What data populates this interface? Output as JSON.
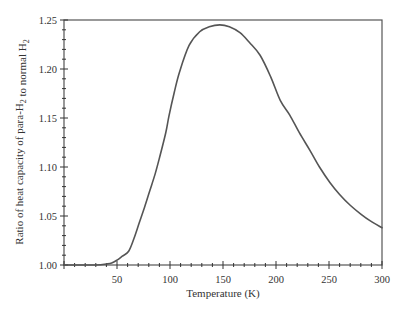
{
  "chart_data": {
    "type": "line",
    "title": "",
    "xlabel": "Temperature (K)",
    "ylabel": "Ratio of heat capacity of para-H₂ to normal H₂",
    "xlim": [
      0,
      300
    ],
    "ylim": [
      1.0,
      1.25
    ],
    "x_ticks": [
      50,
      100,
      150,
      200,
      250,
      300
    ],
    "x_tick_labels": [
      "50",
      "100",
      "150",
      "200",
      "250",
      "300"
    ],
    "x_minor_step": 10,
    "y_ticks": [
      1.0,
      1.05,
      1.1,
      1.15,
      1.2,
      1.25
    ],
    "y_tick_labels": [
      "1.00",
      "1.05",
      "1.10",
      "1.15",
      "1.20",
      "1.25"
    ],
    "y_minor_step": 0.01,
    "grid": false,
    "legend": null,
    "series": [
      {
        "name": "para-H2 / normal H2 heat capacity ratio",
        "color": "#555555",
        "x": [
          0,
          10,
          20,
          30,
          40,
          45,
          50,
          55,
          61,
          66,
          71,
          76,
          81,
          86,
          90,
          96,
          99,
          104,
          109,
          118,
          128,
          137,
          147,
          156,
          166,
          175,
          185,
          195,
          204,
          213,
          222,
          232,
          241,
          251,
          260,
          270,
          280,
          289,
          300
        ],
        "y": [
          1.0,
          1.0,
          1.0,
          1.0,
          1.001,
          1.002,
          1.005,
          1.009,
          1.014,
          1.027,
          1.043,
          1.059,
          1.076,
          1.093,
          1.109,
          1.135,
          1.152,
          1.176,
          1.197,
          1.224,
          1.238,
          1.243,
          1.245,
          1.243,
          1.237,
          1.227,
          1.214,
          1.192,
          1.168,
          1.153,
          1.135,
          1.117,
          1.1,
          1.084,
          1.072,
          1.061,
          1.052,
          1.045,
          1.038
        ]
      }
    ]
  }
}
